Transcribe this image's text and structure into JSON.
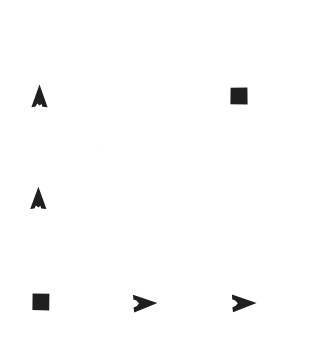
{
  "figure": {
    "background_color": "#ffffff",
    "marker_color": "#1f1f1f",
    "width": 323,
    "height": 363
  },
  "chart_data": {
    "type": "scatter",
    "title": "",
    "subtitle": "",
    "xlabel": "",
    "ylabel": "",
    "xlim": [
      0,
      323
    ],
    "ylim": [
      0,
      363
    ],
    "grid": false,
    "axes_visible": false,
    "tick_labels_x": [],
    "tick_labels_y": [],
    "legend": [],
    "annotations": [],
    "marker_color": "#1f1f1f",
    "series": [
      {
        "name": "triangle-up",
        "marker": "triangle-up",
        "points": [
          {
            "label": "triangle-up-1",
            "x": 39,
            "y": 96,
            "px_left": 30,
            "px_top": 84,
            "px_width": 19,
            "px_height": 24
          },
          {
            "label": "triangle-up-2",
            "x": 38,
            "y": 198,
            "px_left": 29,
            "px_top": 186,
            "px_width": 19,
            "px_height": 24
          }
        ]
      },
      {
        "name": "square",
        "marker": "square-filled",
        "points": [
          {
            "label": "square-1",
            "x": 239,
            "y": 96,
            "px_left": 230,
            "px_top": 87,
            "px_width": 18,
            "px_height": 18
          },
          {
            "label": "square-2",
            "x": 41,
            "y": 302,
            "px_left": 32,
            "px_top": 293,
            "px_width": 18,
            "px_height": 18
          }
        ]
      },
      {
        "name": "triangle-right",
        "marker": "pennant-right",
        "points": [
          {
            "label": "triangle-right-1",
            "x": 145,
            "y": 303,
            "px_left": 132,
            "px_top": 294,
            "px_width": 26,
            "px_height": 19
          },
          {
            "label": "triangle-right-2",
            "x": 244,
            "y": 303,
            "px_left": 231,
            "px_top": 294,
            "px_width": 26,
            "px_height": 19
          }
        ]
      }
    ]
  }
}
